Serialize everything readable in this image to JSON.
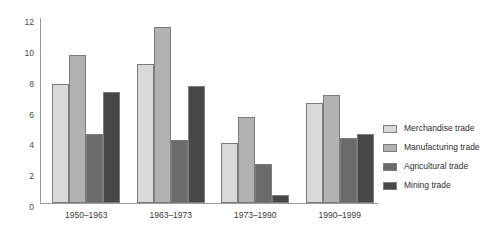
{
  "chart_data": {
    "type": "bar",
    "title": "",
    "subtitle": "",
    "xlabel": "",
    "ylabel": "",
    "ylim": [
      0,
      12
    ],
    "yticks": [
      0,
      2,
      4,
      6,
      8,
      10,
      12
    ],
    "ytick_labels": [
      "0",
      "2",
      "4",
      "6",
      "8",
      "10",
      "12"
    ],
    "grid": false,
    "legend_position": "right",
    "categories": [
      "1950–1963",
      "1963–1973",
      "1973–1990",
      "1990–1999"
    ],
    "series": [
      {
        "name": "Merchandise trade",
        "color": "#d9d9d9",
        "values": [
          7.7,
          9.0,
          3.9,
          6.5
        ]
      },
      {
        "name": "Manufacturing trade",
        "color": "#b2b2b2",
        "values": [
          9.6,
          11.4,
          5.6,
          7.0
        ]
      },
      {
        "name": "Agricultural trade",
        "color": "#6b6b6b",
        "values": [
          4.5,
          4.1,
          2.5,
          4.2
        ]
      },
      {
        "name": "Mining trade",
        "color": "#474747",
        "values": [
          7.2,
          7.6,
          0.5,
          4.5
        ]
      }
    ]
  },
  "axis": {
    "line_color": "#9a9a9a"
  }
}
